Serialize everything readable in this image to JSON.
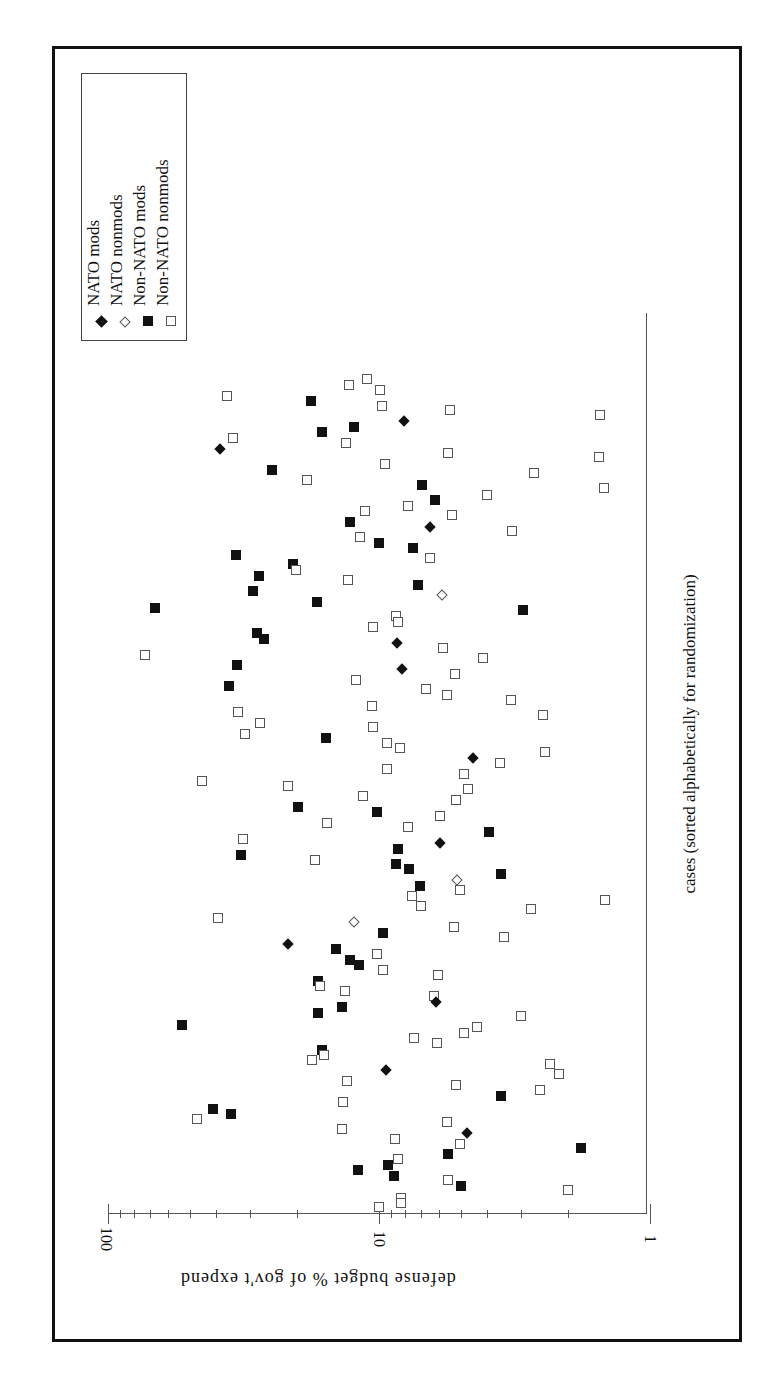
{
  "chart_data": {
    "type": "scatter",
    "orientation": "rotated 90deg clockwise (value axis horizontal at bottom, reversed; category axis vertical on right)",
    "title": "",
    "xlabel": "cases (sorted alphabetically for randomization)",
    "ylabel": "defense budget % of gov't expend",
    "yscale": "log",
    "ylim": [
      1,
      100
    ],
    "yticks": [
      "100",
      "10",
      "1"
    ],
    "grid": false,
    "legend_position": "upper-left box (rotated)",
    "legend": [
      {
        "name": "NATO mods",
        "marker": "filled-diamond"
      },
      {
        "name": "NATO nonmods",
        "marker": "open-diamond"
      },
      {
        "name": "Non-NATO mods",
        "marker": "filled-square"
      },
      {
        "name": "Non-NATO nonmods",
        "marker": "open-square"
      }
    ],
    "axis_geometry": {
      "x100": 108,
      "x10": 379,
      "x1": 650,
      "case_top": 313,
      "case_bottom": 1214
    },
    "points": [
      {
        "s": "open-sq",
        "sx": 227,
        "sy": 396
      },
      {
        "s": "filled-sq",
        "sx": 311,
        "sy": 401
      },
      {
        "s": "open-sq",
        "sx": 349,
        "sy": 385
      },
      {
        "s": "open-sq",
        "sx": 367,
        "sy": 379
      },
      {
        "s": "open-sq",
        "sx": 380,
        "sy": 390
      },
      {
        "s": "open-sq",
        "sx": 382,
        "sy": 406
      },
      {
        "s": "filled-dia",
        "sx": 404,
        "sy": 421
      },
      {
        "s": "open-sq",
        "sx": 450,
        "sy": 410
      },
      {
        "s": "open-sq",
        "sx": 600,
        "sy": 415
      },
      {
        "s": "filled-sq",
        "sx": 322,
        "sy": 432
      },
      {
        "s": "filled-sq",
        "sx": 354,
        "sy": 427
      },
      {
        "s": "open-sq",
        "sx": 346,
        "sy": 443
      },
      {
        "s": "open-sq",
        "sx": 233,
        "sy": 438
      },
      {
        "s": "filled-dia",
        "sx": 220,
        "sy": 449
      },
      {
        "s": "open-sq",
        "sx": 448,
        "sy": 453
      },
      {
        "s": "open-sq",
        "sx": 599,
        "sy": 457
      },
      {
        "s": "filled-sq",
        "sx": 272,
        "sy": 470
      },
      {
        "s": "open-sq",
        "sx": 307,
        "sy": 480
      },
      {
        "s": "open-sq",
        "sx": 385,
        "sy": 464
      },
      {
        "s": "open-sq",
        "sx": 534,
        "sy": 473
      },
      {
        "s": "open-sq",
        "sx": 604,
        "sy": 488
      },
      {
        "s": "filled-sq",
        "sx": 422,
        "sy": 485
      },
      {
        "s": "filled-sq",
        "sx": 435,
        "sy": 500
      },
      {
        "s": "open-sq",
        "sx": 487,
        "sy": 495
      },
      {
        "s": "open-sq",
        "sx": 408,
        "sy": 506
      },
      {
        "s": "open-sq",
        "sx": 452,
        "sy": 515
      },
      {
        "s": "open-sq",
        "sx": 365,
        "sy": 511
      },
      {
        "s": "filled-sq",
        "sx": 350,
        "sy": 522
      },
      {
        "s": "open-sq",
        "sx": 360,
        "sy": 537
      },
      {
        "s": "filled-sq",
        "sx": 379,
        "sy": 543
      },
      {
        "s": "filled-sq",
        "sx": 413,
        "sy": 548
      },
      {
        "s": "open-sq",
        "sx": 430,
        "sy": 558
      },
      {
        "s": "open-sq",
        "sx": 512,
        "sy": 531
      },
      {
        "s": "filled-dia",
        "sx": 430,
        "sy": 527
      },
      {
        "s": "filled-sq",
        "sx": 236,
        "sy": 555
      },
      {
        "s": "filled-sq",
        "sx": 293,
        "sy": 564
      },
      {
        "s": "open-sq",
        "sx": 296,
        "sy": 570
      },
      {
        "s": "filled-sq",
        "sx": 259,
        "sy": 576
      },
      {
        "s": "filled-sq",
        "sx": 253,
        "sy": 591
      },
      {
        "s": "open-sq",
        "sx": 348,
        "sy": 580
      },
      {
        "s": "filled-sq",
        "sx": 418,
        "sy": 585
      },
      {
        "s": "open-dia",
        "sx": 442,
        "sy": 595
      },
      {
        "s": "filled-sq",
        "sx": 155,
        "sy": 608
      },
      {
        "s": "filled-sq",
        "sx": 317,
        "sy": 602
      },
      {
        "s": "filled-sq",
        "sx": 523,
        "sy": 610
      },
      {
        "s": "open-sq",
        "sx": 396,
        "sy": 616
      },
      {
        "s": "open-sq",
        "sx": 398,
        "sy": 622
      },
      {
        "s": "open-sq",
        "sx": 373,
        "sy": 627
      },
      {
        "s": "filled-sq",
        "sx": 257,
        "sy": 633
      },
      {
        "s": "filled-sq",
        "sx": 264,
        "sy": 639
      },
      {
        "s": "filled-dia",
        "sx": 397,
        "sy": 643
      },
      {
        "s": "open-sq",
        "sx": 443,
        "sy": 648
      },
      {
        "s": "open-sq",
        "sx": 483,
        "sy": 658
      },
      {
        "s": "open-sq",
        "sx": 145,
        "sy": 655
      },
      {
        "s": "filled-sq",
        "sx": 237,
        "sy": 665
      },
      {
        "s": "filled-dia",
        "sx": 402,
        "sy": 669
      },
      {
        "s": "open-sq",
        "sx": 455,
        "sy": 674
      },
      {
        "s": "open-sq",
        "sx": 356,
        "sy": 680
      },
      {
        "s": "filled-sq",
        "sx": 229,
        "sy": 686
      },
      {
        "s": "open-sq",
        "sx": 426,
        "sy": 689
      },
      {
        "s": "open-sq",
        "sx": 447,
        "sy": 695
      },
      {
        "s": "open-sq",
        "sx": 511,
        "sy": 700
      },
      {
        "s": "open-sq",
        "sx": 543,
        "sy": 715
      },
      {
        "s": "open-sq",
        "sx": 372,
        "sy": 706
      },
      {
        "s": "open-sq",
        "sx": 238,
        "sy": 712
      },
      {
        "s": "open-sq",
        "sx": 260,
        "sy": 723
      },
      {
        "s": "open-sq",
        "sx": 245,
        "sy": 734
      },
      {
        "s": "open-sq",
        "sx": 373,
        "sy": 727
      },
      {
        "s": "filled-sq",
        "sx": 326,
        "sy": 738
      },
      {
        "s": "open-sq",
        "sx": 387,
        "sy": 743
      },
      {
        "s": "open-sq",
        "sx": 400,
        "sy": 748
      },
      {
        "s": "filled-dia",
        "sx": 473,
        "sy": 758
      },
      {
        "s": "open-sq",
        "sx": 500,
        "sy": 763
      },
      {
        "s": "open-sq",
        "sx": 545,
        "sy": 752
      },
      {
        "s": "open-sq",
        "sx": 387,
        "sy": 769
      },
      {
        "s": "open-sq",
        "sx": 202,
        "sy": 781
      },
      {
        "s": "open-sq",
        "sx": 464,
        "sy": 774
      },
      {
        "s": "open-sq",
        "sx": 288,
        "sy": 786
      },
      {
        "s": "open-sq",
        "sx": 468,
        "sy": 789
      },
      {
        "s": "open-sq",
        "sx": 363,
        "sy": 796
      },
      {
        "s": "open-sq",
        "sx": 456,
        "sy": 800
      },
      {
        "s": "filled-sq",
        "sx": 298,
        "sy": 807
      },
      {
        "s": "filled-sq",
        "sx": 377,
        "sy": 812
      },
      {
        "s": "open-sq",
        "sx": 327,
        "sy": 823
      },
      {
        "s": "open-sq",
        "sx": 440,
        "sy": 816
      },
      {
        "s": "open-sq",
        "sx": 408,
        "sy": 827
      },
      {
        "s": "filled-sq",
        "sx": 489,
        "sy": 832
      },
      {
        "s": "open-sq",
        "sx": 243,
        "sy": 839
      },
      {
        "s": "filled-dia",
        "sx": 440,
        "sy": 843
      },
      {
        "s": "filled-sq",
        "sx": 241,
        "sy": 855
      },
      {
        "s": "filled-sq",
        "sx": 398,
        "sy": 849
      },
      {
        "s": "filled-sq",
        "sx": 396,
        "sy": 864
      },
      {
        "s": "filled-sq",
        "sx": 409,
        "sy": 869
      },
      {
        "s": "open-sq",
        "sx": 315,
        "sy": 860
      },
      {
        "s": "filled-sq",
        "sx": 501,
        "sy": 874
      },
      {
        "s": "open-dia",
        "sx": 457,
        "sy": 880
      },
      {
        "s": "open-sq",
        "sx": 460,
        "sy": 890
      },
      {
        "s": "filled-sq",
        "sx": 420,
        "sy": 886
      },
      {
        "s": "open-sq",
        "sx": 412,
        "sy": 896
      },
      {
        "s": "open-sq",
        "sx": 421,
        "sy": 906
      },
      {
        "s": "open-sq",
        "sx": 531,
        "sy": 909
      },
      {
        "s": "open-sq",
        "sx": 605,
        "sy": 900
      },
      {
        "s": "open-sq",
        "sx": 218,
        "sy": 918
      },
      {
        "s": "open-dia",
        "sx": 354,
        "sy": 922
      },
      {
        "s": "filled-sq",
        "sx": 383,
        "sy": 933
      },
      {
        "s": "open-sq",
        "sx": 454,
        "sy": 927
      },
      {
        "s": "open-sq",
        "sx": 504,
        "sy": 937
      },
      {
        "s": "filled-dia",
        "sx": 288,
        "sy": 944
      },
      {
        "s": "filled-sq",
        "sx": 336,
        "sy": 949
      },
      {
        "s": "filled-sq",
        "sx": 350,
        "sy": 960
      },
      {
        "s": "filled-sq",
        "sx": 359,
        "sy": 965
      },
      {
        "s": "open-sq",
        "sx": 377,
        "sy": 954
      },
      {
        "s": "open-sq",
        "sx": 383,
        "sy": 970
      },
      {
        "s": "open-sq",
        "sx": 438,
        "sy": 975
      },
      {
        "s": "filled-sq",
        "sx": 318,
        "sy": 981
      },
      {
        "s": "open-sq",
        "sx": 320,
        "sy": 986
      },
      {
        "s": "open-sq",
        "sx": 345,
        "sy": 991
      },
      {
        "s": "open-sq",
        "sx": 434,
        "sy": 996
      },
      {
        "s": "filled-dia",
        "sx": 436,
        "sy": 1002
      },
      {
        "s": "filled-sq",
        "sx": 318,
        "sy": 1013
      },
      {
        "s": "filled-sq",
        "sx": 342,
        "sy": 1007
      },
      {
        "s": "open-sq",
        "sx": 521,
        "sy": 1016
      },
      {
        "s": "filled-sq",
        "sx": 182,
        "sy": 1025
      },
      {
        "s": "open-sq",
        "sx": 414,
        "sy": 1038
      },
      {
        "s": "open-sq",
        "sx": 437,
        "sy": 1043
      },
      {
        "s": "open-sq",
        "sx": 464,
        "sy": 1033
      },
      {
        "s": "open-sq",
        "sx": 477,
        "sy": 1027
      },
      {
        "s": "filled-sq",
        "sx": 322,
        "sy": 1050
      },
      {
        "s": "open-sq",
        "sx": 324,
        "sy": 1055
      },
      {
        "s": "open-sq",
        "sx": 312,
        "sy": 1060
      },
      {
        "s": "filled-dia",
        "sx": 386,
        "sy": 1070
      },
      {
        "s": "open-sq",
        "sx": 550,
        "sy": 1064
      },
      {
        "s": "open-sq",
        "sx": 559,
        "sy": 1074
      },
      {
        "s": "open-sq",
        "sx": 347,
        "sy": 1081
      },
      {
        "s": "open-sq",
        "sx": 456,
        "sy": 1085
      },
      {
        "s": "open-sq",
        "sx": 540,
        "sy": 1090
      },
      {
        "s": "filled-sq",
        "sx": 501,
        "sy": 1096
      },
      {
        "s": "open-sq",
        "sx": 343,
        "sy": 1102
      },
      {
        "s": "filled-sq",
        "sx": 213,
        "sy": 1109
      },
      {
        "s": "filled-sq",
        "sx": 231,
        "sy": 1114
      },
      {
        "s": "open-sq",
        "sx": 197,
        "sy": 1119
      },
      {
        "s": "open-sq",
        "sx": 342,
        "sy": 1129
      },
      {
        "s": "open-sq",
        "sx": 447,
        "sy": 1122
      },
      {
        "s": "filled-dia",
        "sx": 467,
        "sy": 1133
      },
      {
        "s": "open-sq",
        "sx": 395,
        "sy": 1139
      },
      {
        "s": "open-sq",
        "sx": 460,
        "sy": 1144
      },
      {
        "s": "filled-sq",
        "sx": 581,
        "sy": 1148
      },
      {
        "s": "filled-sq",
        "sx": 448,
        "sy": 1154
      },
      {
        "s": "filled-sq",
        "sx": 358,
        "sy": 1170
      },
      {
        "s": "filled-sq",
        "sx": 388,
        "sy": 1165
      },
      {
        "s": "open-sq",
        "sx": 398,
        "sy": 1159
      },
      {
        "s": "filled-sq",
        "sx": 394,
        "sy": 1176
      },
      {
        "s": "open-sq",
        "sx": 448,
        "sy": 1180
      },
      {
        "s": "filled-sq",
        "sx": 461,
        "sy": 1186
      },
      {
        "s": "open-sq",
        "sx": 568,
        "sy": 1190
      },
      {
        "s": "open-sq",
        "sx": 401,
        "sy": 1198
      },
      {
        "s": "open-sq",
        "sx": 401,
        "sy": 1203
      },
      {
        "s": "open-sq",
        "sx": 379,
        "sy": 1207
      }
    ]
  },
  "legend": {
    "items": [
      {
        "label": "NATO mods"
      },
      {
        "label": "NATO nonmods"
      },
      {
        "label": "Non-NATO mods"
      },
      {
        "label": "Non-NATO nonmods"
      }
    ]
  },
  "axes": {
    "value_axis_title": "defense budget % of gov't expend",
    "category_axis_title": "cases (sorted alphabetically for randomization)",
    "tick_labels": [
      "100",
      "10",
      "1"
    ]
  }
}
